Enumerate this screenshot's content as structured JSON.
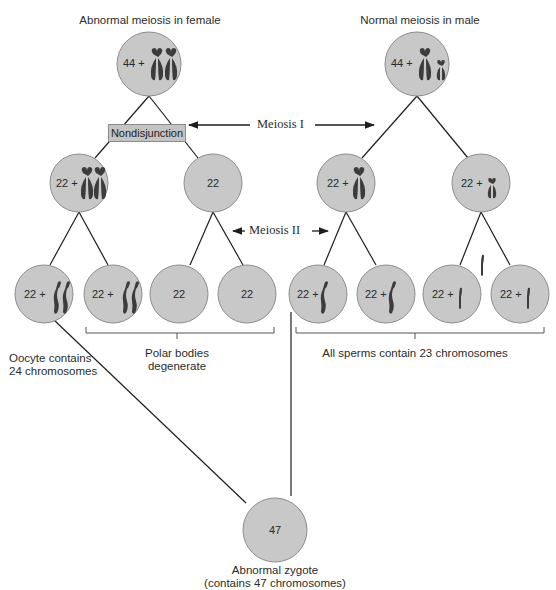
{
  "titles": {
    "female": "Abnormal meiosis in female",
    "male": "Normal meiosis in male"
  },
  "arrows": {
    "meiosis_1": "Meiosis I",
    "meiosis_2": "Meiosis II"
  },
  "nondisjunction_label": "Nondisjunction",
  "female": {
    "top": "44 +",
    "level2": [
      "22 +",
      "22"
    ],
    "level3": [
      "22 +",
      "22 +",
      "22",
      "22"
    ]
  },
  "male": {
    "top": "44 +",
    "level2": [
      "22 +",
      "22 +"
    ],
    "level3": [
      "22 +",
      "22 +",
      "22 +",
      "22 +"
    ]
  },
  "zygote": {
    "value": "47",
    "caption_line1": "Abnormal zygote",
    "caption_line2": "(contains 47 chromosomes)"
  },
  "annotations": {
    "oocyte_line1": "Oocyte contains",
    "oocyte_line2": "24 chromosomes",
    "polar_line1": "Polar bodies",
    "polar_line2": "degenerate",
    "sperms": "All sperms contain 23 chromosomes"
  },
  "colors": {
    "cell_fill": "#c8c8c8",
    "cell_stroke": "#8c8c8c",
    "chromosome": "#3c3c3c",
    "line": "#1e1e1e",
    "box_fill": "#c4c4c4"
  }
}
